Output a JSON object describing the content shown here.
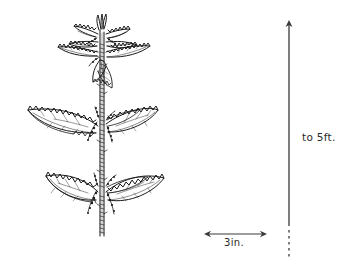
{
  "figure": {
    "subject_name": "stinging-nettle-plant",
    "line_color": "#1a1a1a",
    "background_color": "#ffffff",
    "stem_color": "#3a3a3a"
  },
  "scale": {
    "height": {
      "label": "to 5ft.",
      "icon": "vertical-double-arrow-icon",
      "axis": "vertical"
    },
    "width": {
      "label": "3in.",
      "icon": "horizontal-double-arrow-icon",
      "axis": "horizontal"
    }
  }
}
